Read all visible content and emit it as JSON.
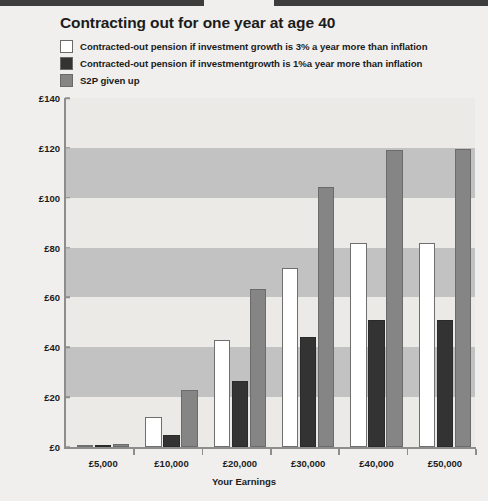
{
  "chart_data": {
    "type": "bar",
    "title": "Contracting out for one year at age 40",
    "xlabel": "Your Earnings",
    "ylabel": "Yearly pension",
    "categories": [
      "£5,000",
      "£10,000",
      "£20,000",
      "£30,000",
      "£40,000",
      "£50,000"
    ],
    "series": [
      {
        "name": "Contracted-out pension if investment growth is 3% a year more than inflation",
        "color": "#ffffff",
        "values": [
          0.8,
          12,
          43,
          72,
          82,
          82
        ]
      },
      {
        "name": "Contracted-out pension if investmentgrowth is 1%a year more than inflation",
        "color": "#333333",
        "values": [
          0.5,
          5,
          26.5,
          44,
          51,
          51
        ]
      },
      {
        "name": "S2P given up",
        "color": "#858585",
        "values": [
          1.2,
          23,
          63.5,
          104.5,
          119,
          119.5
        ]
      }
    ],
    "ylim": [
      0,
      140
    ],
    "yticks": [
      "£0",
      "£20",
      "£40",
      "£60",
      "£80",
      "£100",
      "£120",
      "£140"
    ],
    "ytick_values": [
      0,
      20,
      40,
      60,
      80,
      100,
      120,
      140
    ],
    "grid": false,
    "bands": [
      [
        20,
        40
      ],
      [
        60,
        80
      ],
      [
        100,
        120
      ]
    ],
    "legend_position": "top-left"
  },
  "legend": {
    "items": [
      {
        "label": "Contracted-out pension if investment growth is 3% a year more than inflation",
        "swatch": "#ffffff"
      },
      {
        "label": "Contracted-out pension if investmentgrowth is 1%a year more than inflation",
        "swatch": "#333333"
      },
      {
        "label": "S2P given up",
        "swatch": "#858585"
      }
    ]
  },
  "colors": {
    "background": "#f0efed",
    "plot_background": "#eceae7",
    "band": "#c2c2c2",
    "axis": "#8d8d8d",
    "rule": "#3d3d3d",
    "text": "#1c1c1c"
  }
}
